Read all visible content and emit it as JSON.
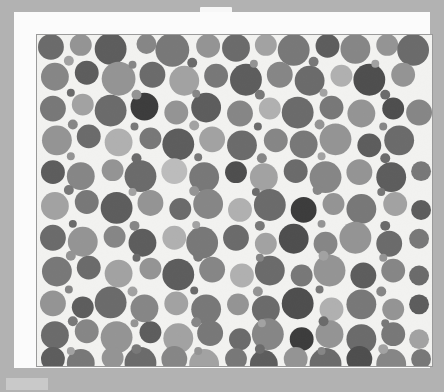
{
  "canvas": {
    "width": 444,
    "height": 392,
    "background_color": "#b2b2b2"
  },
  "sheet": {
    "name": "white-page-sheet",
    "background_color": "#fbfbfb",
    "notch_color": "#f7f7f7"
  },
  "bottom_bar": {
    "name": "bottom-left-bar",
    "color": "#c9c9c9"
  },
  "figure": {
    "title": "",
    "background_color": "#f2f2f0",
    "border_color": "#9a9a9a",
    "palette": [
      "#3c3c3c",
      "#4e4e4e",
      "#5d5d5d",
      "#6b6b6b",
      "#787878",
      "#868686",
      "#949494",
      "#a2a2a2",
      "#b0b0b0",
      "#bcbcbc"
    ]
  },
  "chart_data": {
    "type": "scatter",
    "subtype": "circle-packing",
    "title": "",
    "xlabel": "",
    "ylabel": "",
    "grid": false,
    "legend": null,
    "xlim": [
      0,
      397
    ],
    "ylim": [
      0,
      333
    ],
    "value_label": "gray level",
    "circles": [
      {
        "x": 14,
        "y": 12,
        "r": 13,
        "c": "#6b6b6b"
      },
      {
        "x": 44,
        "y": 10,
        "r": 11,
        "c": "#949494"
      },
      {
        "x": 74,
        "y": 14,
        "r": 16,
        "c": "#5d5d5d"
      },
      {
        "x": 110,
        "y": 9,
        "r": 10,
        "c": "#868686"
      },
      {
        "x": 136,
        "y": 15,
        "r": 17,
        "c": "#787878"
      },
      {
        "x": 172,
        "y": 11,
        "r": 12,
        "c": "#949494"
      },
      {
        "x": 200,
        "y": 13,
        "r": 14,
        "c": "#6b6b6b"
      },
      {
        "x": 230,
        "y": 10,
        "r": 11,
        "c": "#a2a2a2"
      },
      {
        "x": 258,
        "y": 15,
        "r": 16,
        "c": "#787878"
      },
      {
        "x": 292,
        "y": 11,
        "r": 12,
        "c": "#5d5d5d"
      },
      {
        "x": 320,
        "y": 14,
        "r": 15,
        "c": "#868686"
      },
      {
        "x": 352,
        "y": 10,
        "r": 11,
        "c": "#949494"
      },
      {
        "x": 378,
        "y": 15,
        "r": 16,
        "c": "#6b6b6b"
      },
      {
        "x": 18,
        "y": 42,
        "r": 14,
        "c": "#868686"
      },
      {
        "x": 50,
        "y": 38,
        "r": 12,
        "c": "#5d5d5d"
      },
      {
        "x": 82,
        "y": 44,
        "r": 17,
        "c": "#949494"
      },
      {
        "x": 116,
        "y": 40,
        "r": 13,
        "c": "#6b6b6b"
      },
      {
        "x": 148,
        "y": 46,
        "r": 15,
        "c": "#a2a2a2"
      },
      {
        "x": 180,
        "y": 41,
        "r": 12,
        "c": "#787878"
      },
      {
        "x": 210,
        "y": 45,
        "r": 16,
        "c": "#5d5d5d"
      },
      {
        "x": 244,
        "y": 40,
        "r": 13,
        "c": "#868686"
      },
      {
        "x": 274,
        "y": 46,
        "r": 15,
        "c": "#6b6b6b"
      },
      {
        "x": 306,
        "y": 41,
        "r": 11,
        "c": "#b0b0b0"
      },
      {
        "x": 334,
        "y": 45,
        "r": 16,
        "c": "#4e4e4e"
      },
      {
        "x": 368,
        "y": 40,
        "r": 12,
        "c": "#949494"
      },
      {
        "x": 16,
        "y": 74,
        "r": 13,
        "c": "#787878"
      },
      {
        "x": 46,
        "y": 70,
        "r": 11,
        "c": "#a2a2a2"
      },
      {
        "x": 74,
        "y": 76,
        "r": 16,
        "c": "#6b6b6b"
      },
      {
        "x": 108,
        "y": 72,
        "r": 14,
        "c": "#3c3c3c"
      },
      {
        "x": 140,
        "y": 78,
        "r": 12,
        "c": "#949494"
      },
      {
        "x": 170,
        "y": 73,
        "r": 15,
        "c": "#5d5d5d"
      },
      {
        "x": 204,
        "y": 79,
        "r": 13,
        "c": "#868686"
      },
      {
        "x": 234,
        "y": 74,
        "r": 11,
        "c": "#b0b0b0"
      },
      {
        "x": 262,
        "y": 78,
        "r": 16,
        "c": "#6b6b6b"
      },
      {
        "x": 296,
        "y": 73,
        "r": 12,
        "c": "#787878"
      },
      {
        "x": 326,
        "y": 79,
        "r": 14,
        "c": "#949494"
      },
      {
        "x": 358,
        "y": 74,
        "r": 11,
        "c": "#4e4e4e"
      },
      {
        "x": 384,
        "y": 78,
        "r": 13,
        "c": "#868686"
      },
      {
        "x": 20,
        "y": 106,
        "r": 15,
        "c": "#949494"
      },
      {
        "x": 52,
        "y": 102,
        "r": 12,
        "c": "#6b6b6b"
      },
      {
        "x": 82,
        "y": 108,
        "r": 14,
        "c": "#b0b0b0"
      },
      {
        "x": 114,
        "y": 104,
        "r": 11,
        "c": "#787878"
      },
      {
        "x": 142,
        "y": 110,
        "r": 16,
        "c": "#5d5d5d"
      },
      {
        "x": 176,
        "y": 105,
        "r": 13,
        "c": "#a2a2a2"
      },
      {
        "x": 206,
        "y": 111,
        "r": 15,
        "c": "#6b6b6b"
      },
      {
        "x": 240,
        "y": 106,
        "r": 12,
        "c": "#868686"
      },
      {
        "x": 268,
        "y": 110,
        "r": 14,
        "c": "#787878"
      },
      {
        "x": 300,
        "y": 105,
        "r": 16,
        "c": "#949494"
      },
      {
        "x": 334,
        "y": 111,
        "r": 12,
        "c": "#5d5d5d"
      },
      {
        "x": 364,
        "y": 106,
        "r": 15,
        "c": "#6b6b6b"
      },
      {
        "x": 16,
        "y": 138,
        "r": 12,
        "c": "#5d5d5d"
      },
      {
        "x": 44,
        "y": 142,
        "r": 14,
        "c": "#868686"
      },
      {
        "x": 76,
        "y": 136,
        "r": 11,
        "c": "#949494"
      },
      {
        "x": 104,
        "y": 142,
        "r": 16,
        "c": "#6b6b6b"
      },
      {
        "x": 138,
        "y": 137,
        "r": 13,
        "c": "#bcbcbc"
      },
      {
        "x": 168,
        "y": 143,
        "r": 15,
        "c": "#787878"
      },
      {
        "x": 200,
        "y": 138,
        "r": 11,
        "c": "#4e4e4e"
      },
      {
        "x": 228,
        "y": 143,
        "r": 14,
        "c": "#a2a2a2"
      },
      {
        "x": 260,
        "y": 137,
        "r": 12,
        "c": "#6b6b6b"
      },
      {
        "x": 290,
        "y": 143,
        "r": 16,
        "c": "#868686"
      },
      {
        "x": 324,
        "y": 138,
        "r": 13,
        "c": "#949494"
      },
      {
        "x": 356,
        "y": 143,
        "r": 15,
        "c": "#5d5d5d"
      },
      {
        "x": 386,
        "y": 137,
        "r": 10,
        "c": "#787878"
      },
      {
        "x": 18,
        "y": 172,
        "r": 14,
        "c": "#a2a2a2"
      },
      {
        "x": 50,
        "y": 168,
        "r": 12,
        "c": "#787878"
      },
      {
        "x": 80,
        "y": 174,
        "r": 16,
        "c": "#5d5d5d"
      },
      {
        "x": 114,
        "y": 169,
        "r": 13,
        "c": "#949494"
      },
      {
        "x": 144,
        "y": 175,
        "r": 11,
        "c": "#6b6b6b"
      },
      {
        "x": 172,
        "y": 170,
        "r": 15,
        "c": "#868686"
      },
      {
        "x": 204,
        "y": 176,
        "r": 12,
        "c": "#b0b0b0"
      },
      {
        "x": 234,
        "y": 171,
        "r": 16,
        "c": "#6b6b6b"
      },
      {
        "x": 268,
        "y": 176,
        "r": 13,
        "c": "#3c3c3c"
      },
      {
        "x": 298,
        "y": 170,
        "r": 11,
        "c": "#949494"
      },
      {
        "x": 326,
        "y": 175,
        "r": 15,
        "c": "#787878"
      },
      {
        "x": 360,
        "y": 170,
        "r": 12,
        "c": "#a2a2a2"
      },
      {
        "x": 386,
        "y": 176,
        "r": 10,
        "c": "#5d5d5d"
      },
      {
        "x": 16,
        "y": 204,
        "r": 13,
        "c": "#6b6b6b"
      },
      {
        "x": 46,
        "y": 208,
        "r": 15,
        "c": "#949494"
      },
      {
        "x": 78,
        "y": 203,
        "r": 11,
        "c": "#868686"
      },
      {
        "x": 106,
        "y": 209,
        "r": 14,
        "c": "#5d5d5d"
      },
      {
        "x": 138,
        "y": 204,
        "r": 12,
        "c": "#b0b0b0"
      },
      {
        "x": 166,
        "y": 209,
        "r": 16,
        "c": "#787878"
      },
      {
        "x": 200,
        "y": 204,
        "r": 13,
        "c": "#6b6b6b"
      },
      {
        "x": 230,
        "y": 210,
        "r": 11,
        "c": "#a2a2a2"
      },
      {
        "x": 258,
        "y": 205,
        "r": 15,
        "c": "#4e4e4e"
      },
      {
        "x": 290,
        "y": 210,
        "r": 12,
        "c": "#868686"
      },
      {
        "x": 320,
        "y": 204,
        "r": 16,
        "c": "#949494"
      },
      {
        "x": 354,
        "y": 210,
        "r": 13,
        "c": "#6b6b6b"
      },
      {
        "x": 384,
        "y": 205,
        "r": 10,
        "c": "#787878"
      },
      {
        "x": 20,
        "y": 238,
        "r": 15,
        "c": "#787878"
      },
      {
        "x": 52,
        "y": 234,
        "r": 12,
        "c": "#6b6b6b"
      },
      {
        "x": 82,
        "y": 240,
        "r": 14,
        "c": "#a2a2a2"
      },
      {
        "x": 114,
        "y": 235,
        "r": 11,
        "c": "#949494"
      },
      {
        "x": 142,
        "y": 241,
        "r": 16,
        "c": "#5d5d5d"
      },
      {
        "x": 176,
        "y": 236,
        "r": 13,
        "c": "#868686"
      },
      {
        "x": 206,
        "y": 242,
        "r": 12,
        "c": "#b0b0b0"
      },
      {
        "x": 234,
        "y": 237,
        "r": 15,
        "c": "#6b6b6b"
      },
      {
        "x": 266,
        "y": 242,
        "r": 11,
        "c": "#787878"
      },
      {
        "x": 294,
        "y": 237,
        "r": 16,
        "c": "#949494"
      },
      {
        "x": 328,
        "y": 242,
        "r": 13,
        "c": "#5d5d5d"
      },
      {
        "x": 358,
        "y": 237,
        "r": 12,
        "c": "#868686"
      },
      {
        "x": 384,
        "y": 242,
        "r": 10,
        "c": "#6b6b6b"
      },
      {
        "x": 16,
        "y": 270,
        "r": 13,
        "c": "#949494"
      },
      {
        "x": 46,
        "y": 274,
        "r": 11,
        "c": "#5d5d5d"
      },
      {
        "x": 74,
        "y": 269,
        "r": 16,
        "c": "#6b6b6b"
      },
      {
        "x": 108,
        "y": 275,
        "r": 14,
        "c": "#868686"
      },
      {
        "x": 140,
        "y": 270,
        "r": 12,
        "c": "#a2a2a2"
      },
      {
        "x": 170,
        "y": 276,
        "r": 15,
        "c": "#787878"
      },
      {
        "x": 202,
        "y": 271,
        "r": 11,
        "c": "#949494"
      },
      {
        "x": 230,
        "y": 276,
        "r": 14,
        "c": "#6b6b6b"
      },
      {
        "x": 262,
        "y": 270,
        "r": 16,
        "c": "#4e4e4e"
      },
      {
        "x": 296,
        "y": 276,
        "r": 12,
        "c": "#b0b0b0"
      },
      {
        "x": 326,
        "y": 271,
        "r": 15,
        "c": "#787878"
      },
      {
        "x": 358,
        "y": 276,
        "r": 11,
        "c": "#949494"
      },
      {
        "x": 384,
        "y": 271,
        "r": 10,
        "c": "#5d5d5d"
      },
      {
        "x": 18,
        "y": 302,
        "r": 14,
        "c": "#6b6b6b"
      },
      {
        "x": 50,
        "y": 298,
        "r": 12,
        "c": "#868686"
      },
      {
        "x": 80,
        "y": 304,
        "r": 16,
        "c": "#949494"
      },
      {
        "x": 114,
        "y": 299,
        "r": 11,
        "c": "#5d5d5d"
      },
      {
        "x": 142,
        "y": 305,
        "r": 15,
        "c": "#a2a2a2"
      },
      {
        "x": 174,
        "y": 300,
        "r": 13,
        "c": "#787878"
      },
      {
        "x": 204,
        "y": 306,
        "r": 11,
        "c": "#6b6b6b"
      },
      {
        "x": 232,
        "y": 301,
        "r": 16,
        "c": "#868686"
      },
      {
        "x": 266,
        "y": 306,
        "r": 12,
        "c": "#3c3c3c"
      },
      {
        "x": 294,
        "y": 301,
        "r": 14,
        "c": "#949494"
      },
      {
        "x": 326,
        "y": 306,
        "r": 15,
        "c": "#6b6b6b"
      },
      {
        "x": 358,
        "y": 301,
        "r": 12,
        "c": "#787878"
      },
      {
        "x": 384,
        "y": 306,
        "r": 10,
        "c": "#a2a2a2"
      },
      {
        "x": 16,
        "y": 326,
        "r": 12,
        "c": "#5d5d5d"
      },
      {
        "x": 44,
        "y": 330,
        "r": 14,
        "c": "#787878"
      },
      {
        "x": 76,
        "y": 325,
        "r": 11,
        "c": "#949494"
      },
      {
        "x": 104,
        "y": 330,
        "r": 16,
        "c": "#6b6b6b"
      },
      {
        "x": 138,
        "y": 326,
        "r": 13,
        "c": "#868686"
      },
      {
        "x": 168,
        "y": 331,
        "r": 15,
        "c": "#a2a2a2"
      },
      {
        "x": 200,
        "y": 326,
        "r": 11,
        "c": "#787878"
      },
      {
        "x": 228,
        "y": 331,
        "r": 14,
        "c": "#5d5d5d"
      },
      {
        "x": 260,
        "y": 326,
        "r": 12,
        "c": "#949494"
      },
      {
        "x": 290,
        "y": 331,
        "r": 16,
        "c": "#6b6b6b"
      },
      {
        "x": 324,
        "y": 326,
        "r": 13,
        "c": "#4e4e4e"
      },
      {
        "x": 356,
        "y": 331,
        "r": 15,
        "c": "#868686"
      },
      {
        "x": 386,
        "y": 326,
        "r": 10,
        "c": "#787878"
      },
      {
        "x": 32,
        "y": 26,
        "r": 5,
        "c": "#a2a2a2"
      },
      {
        "x": 96,
        "y": 30,
        "r": 4,
        "c": "#868686"
      },
      {
        "x": 156,
        "y": 28,
        "r": 5,
        "c": "#6b6b6b"
      },
      {
        "x": 218,
        "y": 29,
        "r": 4,
        "c": "#949494"
      },
      {
        "x": 278,
        "y": 27,
        "r": 5,
        "c": "#787878"
      },
      {
        "x": 340,
        "y": 29,
        "r": 4,
        "c": "#a2a2a2"
      },
      {
        "x": 34,
        "y": 58,
        "r": 4,
        "c": "#6b6b6b"
      },
      {
        "x": 100,
        "y": 60,
        "r": 5,
        "c": "#949494"
      },
      {
        "x": 160,
        "y": 59,
        "r": 4,
        "c": "#868686"
      },
      {
        "x": 224,
        "y": 60,
        "r": 5,
        "c": "#787878"
      },
      {
        "x": 288,
        "y": 58,
        "r": 4,
        "c": "#a2a2a2"
      },
      {
        "x": 350,
        "y": 60,
        "r": 5,
        "c": "#6b6b6b"
      },
      {
        "x": 36,
        "y": 90,
        "r": 5,
        "c": "#868686"
      },
      {
        "x": 98,
        "y": 92,
        "r": 4,
        "c": "#787878"
      },
      {
        "x": 158,
        "y": 91,
        "r": 5,
        "c": "#a2a2a2"
      },
      {
        "x": 222,
        "y": 92,
        "r": 4,
        "c": "#6b6b6b"
      },
      {
        "x": 284,
        "y": 90,
        "r": 5,
        "c": "#949494"
      },
      {
        "x": 348,
        "y": 92,
        "r": 4,
        "c": "#868686"
      },
      {
        "x": 34,
        "y": 122,
        "r": 4,
        "c": "#949494"
      },
      {
        "x": 100,
        "y": 124,
        "r": 5,
        "c": "#6b6b6b"
      },
      {
        "x": 162,
        "y": 123,
        "r": 4,
        "c": "#787878"
      },
      {
        "x": 226,
        "y": 124,
        "r": 5,
        "c": "#868686"
      },
      {
        "x": 286,
        "y": 122,
        "r": 4,
        "c": "#a2a2a2"
      },
      {
        "x": 350,
        "y": 124,
        "r": 5,
        "c": "#6b6b6b"
      },
      {
        "x": 32,
        "y": 156,
        "r": 5,
        "c": "#787878"
      },
      {
        "x": 96,
        "y": 158,
        "r": 4,
        "c": "#a2a2a2"
      },
      {
        "x": 158,
        "y": 157,
        "r": 5,
        "c": "#949494"
      },
      {
        "x": 220,
        "y": 158,
        "r": 4,
        "c": "#6b6b6b"
      },
      {
        "x": 282,
        "y": 156,
        "r": 5,
        "c": "#868686"
      },
      {
        "x": 346,
        "y": 158,
        "r": 4,
        "c": "#787878"
      },
      {
        "x": 36,
        "y": 190,
        "r": 4,
        "c": "#6b6b6b"
      },
      {
        "x": 98,
        "y": 192,
        "r": 5,
        "c": "#868686"
      },
      {
        "x": 160,
        "y": 191,
        "r": 4,
        "c": "#a2a2a2"
      },
      {
        "x": 224,
        "y": 192,
        "r": 5,
        "c": "#787878"
      },
      {
        "x": 286,
        "y": 190,
        "r": 4,
        "c": "#949494"
      },
      {
        "x": 350,
        "y": 192,
        "r": 5,
        "c": "#6b6b6b"
      },
      {
        "x": 34,
        "y": 222,
        "r": 5,
        "c": "#949494"
      },
      {
        "x": 100,
        "y": 224,
        "r": 4,
        "c": "#6b6b6b"
      },
      {
        "x": 162,
        "y": 223,
        "r": 5,
        "c": "#787878"
      },
      {
        "x": 224,
        "y": 224,
        "r": 4,
        "c": "#868686"
      },
      {
        "x": 288,
        "y": 222,
        "r": 5,
        "c": "#a2a2a2"
      },
      {
        "x": 348,
        "y": 224,
        "r": 4,
        "c": "#949494"
      },
      {
        "x": 32,
        "y": 256,
        "r": 4,
        "c": "#868686"
      },
      {
        "x": 96,
        "y": 258,
        "r": 5,
        "c": "#a2a2a2"
      },
      {
        "x": 158,
        "y": 257,
        "r": 4,
        "c": "#6b6b6b"
      },
      {
        "x": 222,
        "y": 258,
        "r": 5,
        "c": "#949494"
      },
      {
        "x": 284,
        "y": 256,
        "r": 4,
        "c": "#787878"
      },
      {
        "x": 346,
        "y": 258,
        "r": 5,
        "c": "#868686"
      },
      {
        "x": 36,
        "y": 288,
        "r": 5,
        "c": "#787878"
      },
      {
        "x": 98,
        "y": 290,
        "r": 4,
        "c": "#949494"
      },
      {
        "x": 160,
        "y": 289,
        "r": 5,
        "c": "#868686"
      },
      {
        "x": 226,
        "y": 290,
        "r": 4,
        "c": "#a2a2a2"
      },
      {
        "x": 288,
        "y": 288,
        "r": 5,
        "c": "#6b6b6b"
      },
      {
        "x": 350,
        "y": 290,
        "r": 4,
        "c": "#787878"
      },
      {
        "x": 34,
        "y": 318,
        "r": 4,
        "c": "#a2a2a2"
      },
      {
        "x": 100,
        "y": 316,
        "r": 5,
        "c": "#787878"
      },
      {
        "x": 162,
        "y": 318,
        "r": 4,
        "c": "#949494"
      },
      {
        "x": 224,
        "y": 316,
        "r": 5,
        "c": "#6b6b6b"
      },
      {
        "x": 286,
        "y": 318,
        "r": 4,
        "c": "#868686"
      },
      {
        "x": 348,
        "y": 316,
        "r": 5,
        "c": "#a2a2a2"
      }
    ]
  }
}
